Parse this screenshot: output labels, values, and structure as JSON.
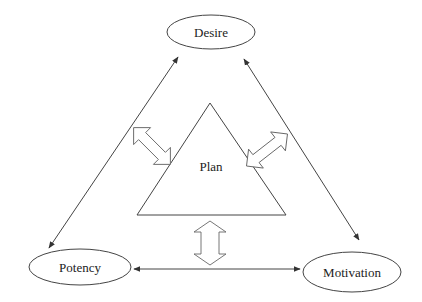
{
  "diagram": {
    "nodes": {
      "desire": {
        "label": "Desire",
        "shape": "ellipse"
      },
      "potency": {
        "label": "Potency",
        "shape": "ellipse"
      },
      "motivation": {
        "label": "Motivation",
        "shape": "ellipse"
      },
      "plan": {
        "label": "Plan",
        "shape": "triangle"
      }
    },
    "edges": [
      {
        "from": "Desire",
        "to": "Potency",
        "type": "bidirectional-line"
      },
      {
        "from": "Desire",
        "to": "Motivation",
        "type": "bidirectional-line"
      },
      {
        "from": "Potency",
        "to": "Motivation",
        "type": "bidirectional-line"
      },
      {
        "from": "Plan",
        "to": "Desire-Potency edge",
        "type": "hollow-double-arrow"
      },
      {
        "from": "Plan",
        "to": "Desire-Motivation edge",
        "type": "hollow-double-arrow"
      },
      {
        "from": "Plan",
        "to": "Potency-Motivation edge",
        "type": "hollow-double-arrow"
      }
    ],
    "colors": {
      "stroke": "#444444",
      "background": "#ffffff"
    }
  }
}
